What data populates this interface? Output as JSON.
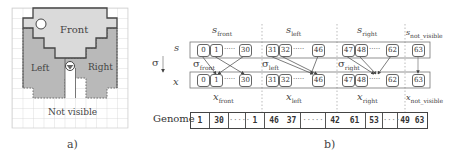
{
  "panel_a": {
    "caption": "a)",
    "regions": {
      "front": "Front",
      "left": "Left",
      "right": "Right",
      "not_visible": "Not visible"
    },
    "colors": {
      "front": "#d9d9d9",
      "left_right": "#b8b8b8",
      "grid": "#c8c8c8",
      "outline": "#555555"
    }
  },
  "panel_b": {
    "caption": "b)",
    "axis_labels": {
      "s": "s",
      "sigma": "σ",
      "x": "x"
    },
    "groups": [
      {
        "id": "front",
        "s_label": "s",
        "s_sub": "front",
        "sigma_sub": "front",
        "x_label": "x",
        "x_sub": "front",
        "s_nodes": [
          "0",
          "1",
          "30"
        ],
        "x_nodes": [
          "0",
          "1",
          "30"
        ]
      },
      {
        "id": "left",
        "s_label": "s",
        "s_sub": "left",
        "sigma_sub": "left",
        "x_label": "x",
        "x_sub": "left",
        "s_nodes": [
          "31",
          "32",
          "46"
        ],
        "x_nodes": [
          "31",
          "32",
          "46"
        ]
      },
      {
        "id": "right",
        "s_label": "s",
        "s_sub": "right",
        "sigma_sub": "right",
        "x_label": "x",
        "x_sub": "right",
        "s_nodes": [
          "47",
          "48",
          "62"
        ],
        "x_nodes": [
          "47",
          "48",
          "62"
        ]
      },
      {
        "id": "not_visible",
        "s_label": "s",
        "s_sub": "not_visible",
        "x_label": "x",
        "x_sub": "not_visible",
        "s_nodes": [
          "63"
        ],
        "x_nodes": [
          "63"
        ]
      }
    ],
    "sigma_symbol": "σ",
    "ellipsis": "·····",
    "genome": {
      "label": "Genome",
      "cells": [
        "1",
        "30",
        "·····",
        "1",
        "46",
        "37",
        "·····",
        "42",
        "61",
        "53",
        "·····",
        "49",
        "63"
      ]
    }
  }
}
